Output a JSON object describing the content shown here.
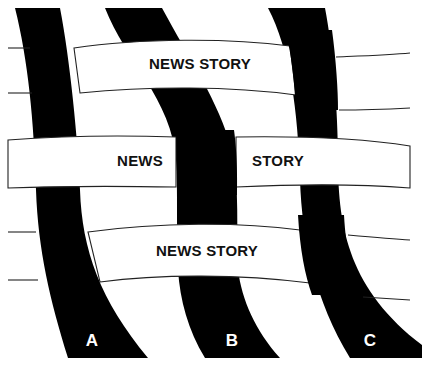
{
  "diagram": {
    "colors": {
      "ribbon": "#000000",
      "band": "#ffffff",
      "text": "#111111",
      "label": "#ffffff",
      "line": "#222222"
    },
    "ribbons": [
      {
        "id": "A",
        "label": "A"
      },
      {
        "id": "B",
        "label": "B"
      },
      {
        "id": "C",
        "label": "C"
      }
    ],
    "bands": [
      {
        "id": "top",
        "text": "NEWS STORY"
      },
      {
        "id": "middle",
        "text_left": "NEWS",
        "text_right": "STORY"
      },
      {
        "id": "bottom",
        "text": "NEWS STORY"
      }
    ]
  }
}
